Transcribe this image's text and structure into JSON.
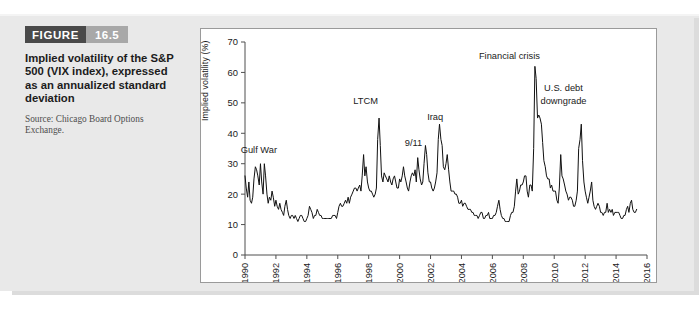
{
  "figure": {
    "label": "FIGURE",
    "number": "16.5",
    "caption": "Implied volatility of the S&P 500 (VIX index), expressed as an annualized standard deviation",
    "source": "Source: Chicago Board Options Exchange."
  },
  "chart_data": {
    "type": "line",
    "title": "",
    "xlabel": "",
    "ylabel": "Implied volatility (%)",
    "xlim": [
      1990,
      2016
    ],
    "ylim": [
      0,
      70
    ],
    "grid": false,
    "legend": "none",
    "yticks": [
      0,
      10,
      20,
      30,
      40,
      50,
      60,
      70
    ],
    "xticks": [
      1990,
      1992,
      1994,
      1996,
      1998,
      2000,
      2002,
      2004,
      2006,
      2008,
      2010,
      2012,
      2014,
      2016
    ],
    "annotations": [
      {
        "text": "Gulf War",
        "x": 1990.9,
        "y": 33.5
      },
      {
        "text": "LTCM",
        "x": 1997.8,
        "y": 49.5
      },
      {
        "text": "9/11",
        "x": 2000.9,
        "y": 36.0
      },
      {
        "text": "Iraq",
        "x": 2002.3,
        "y": 44.5
      },
      {
        "text": "Financial crisis",
        "x": 2007.1,
        "y": 64.5
      },
      {
        "text": "U.S. debt",
        "x": 2010.6,
        "y": 54.0
      },
      {
        "text": "downgrade",
        "x": 2010.6,
        "y": 49.5
      }
    ],
    "series": [
      {
        "name": "VIX",
        "x": [
          1990.0,
          1990.08,
          1990.17,
          1990.25,
          1990.33,
          1990.42,
          1990.5,
          1990.58,
          1990.67,
          1990.75,
          1990.83,
          1990.92,
          1991.0,
          1991.08,
          1991.17,
          1991.25,
          1991.33,
          1991.42,
          1991.5,
          1991.58,
          1991.67,
          1991.75,
          1991.83,
          1991.92,
          1992.0,
          1992.08,
          1992.17,
          1992.25,
          1992.33,
          1992.42,
          1992.5,
          1992.58,
          1992.67,
          1992.75,
          1992.83,
          1992.92,
          1993.0,
          1993.08,
          1993.17,
          1993.25,
          1993.33,
          1993.42,
          1993.5,
          1993.58,
          1993.67,
          1993.75,
          1993.83,
          1993.92,
          1994.0,
          1994.08,
          1994.17,
          1994.25,
          1994.33,
          1994.42,
          1994.5,
          1994.58,
          1994.67,
          1994.75,
          1994.83,
          1994.92,
          1995.0,
          1995.08,
          1995.17,
          1995.25,
          1995.33,
          1995.42,
          1995.5,
          1995.58,
          1995.67,
          1995.75,
          1995.83,
          1995.92,
          1996.0,
          1996.08,
          1996.17,
          1996.25,
          1996.33,
          1996.42,
          1996.5,
          1996.58,
          1996.67,
          1996.75,
          1996.83,
          1996.92,
          1997.0,
          1997.08,
          1997.17,
          1997.25,
          1997.33,
          1997.42,
          1997.5,
          1997.58,
          1997.67,
          1997.75,
          1997.83,
          1997.92,
          1998.0,
          1998.08,
          1998.17,
          1998.25,
          1998.33,
          1998.42,
          1998.5,
          1998.58,
          1998.67,
          1998.75,
          1998.83,
          1998.92,
          1999.0,
          1999.08,
          1999.17,
          1999.25,
          1999.33,
          1999.42,
          1999.5,
          1999.58,
          1999.67,
          1999.75,
          1999.83,
          1999.92,
          2000.0,
          2000.08,
          2000.17,
          2000.25,
          2000.33,
          2000.42,
          2000.5,
          2000.58,
          2000.67,
          2000.75,
          2000.83,
          2000.92,
          2001.0,
          2001.08,
          2001.17,
          2001.25,
          2001.33,
          2001.42,
          2001.5,
          2001.58,
          2001.67,
          2001.75,
          2001.83,
          2001.92,
          2002.0,
          2002.08,
          2002.17,
          2002.25,
          2002.33,
          2002.42,
          2002.5,
          2002.58,
          2002.67,
          2002.75,
          2002.83,
          2002.92,
          2003.0,
          2003.08,
          2003.17,
          2003.25,
          2003.33,
          2003.42,
          2003.5,
          2003.58,
          2003.67,
          2003.75,
          2003.83,
          2003.92,
          2004.0,
          2004.08,
          2004.17,
          2004.25,
          2004.33,
          2004.42,
          2004.5,
          2004.58,
          2004.67,
          2004.75,
          2004.83,
          2004.92,
          2005.0,
          2005.08,
          2005.17,
          2005.25,
          2005.33,
          2005.42,
          2005.5,
          2005.58,
          2005.67,
          2005.75,
          2005.83,
          2005.92,
          2006.0,
          2006.08,
          2006.17,
          2006.25,
          2006.33,
          2006.42,
          2006.5,
          2006.58,
          2006.67,
          2006.75,
          2006.83,
          2006.92,
          2007.0,
          2007.08,
          2007.17,
          2007.25,
          2007.33,
          2007.42,
          2007.5,
          2007.58,
          2007.67,
          2007.75,
          2007.83,
          2007.92,
          2008.0,
          2008.08,
          2008.17,
          2008.25,
          2008.33,
          2008.42,
          2008.5,
          2008.58,
          2008.67,
          2008.75,
          2008.83,
          2008.92,
          2009.0,
          2009.08,
          2009.17,
          2009.25,
          2009.33,
          2009.42,
          2009.5,
          2009.58,
          2009.67,
          2009.75,
          2009.83,
          2009.92,
          2010.0,
          2010.08,
          2010.17,
          2010.25,
          2010.33,
          2010.42,
          2010.5,
          2010.58,
          2010.67,
          2010.75,
          2010.83,
          2010.92,
          2011.0,
          2011.08,
          2011.17,
          2011.25,
          2011.33,
          2011.42,
          2011.5,
          2011.58,
          2011.67,
          2011.75,
          2011.83,
          2011.92,
          2012.0,
          2012.08,
          2012.17,
          2012.25,
          2012.33,
          2012.42,
          2012.5,
          2012.58,
          2012.67,
          2012.75,
          2012.83,
          2012.92,
          2013.0,
          2013.08,
          2013.17,
          2013.25,
          2013.33,
          2013.42,
          2013.5,
          2013.58,
          2013.67,
          2013.75,
          2013.83,
          2013.92,
          2014.0,
          2014.08,
          2014.17,
          2014.25,
          2014.33,
          2014.42,
          2014.5,
          2014.58,
          2014.67,
          2014.75,
          2014.83,
          2014.92,
          2015.0,
          2015.08,
          2015.17,
          2015.25,
          2015.33
        ],
        "values": [
          26,
          22,
          19,
          24,
          18,
          17,
          19,
          25,
          29,
          28,
          26,
          23,
          30,
          24,
          20,
          30,
          26,
          20,
          17,
          19,
          18,
          21,
          19,
          16,
          18,
          16,
          15,
          17,
          15,
          14,
          13,
          16,
          18,
          15,
          13,
          12,
          13,
          13,
          12,
          13,
          12,
          11,
          12,
          13,
          13,
          12,
          11,
          11,
          12,
          13,
          16,
          15,
          14,
          12,
          13,
          13,
          15,
          14,
          13,
          13,
          12,
          12,
          12,
          12,
          12,
          12,
          12,
          12,
          13,
          13,
          13,
          12,
          14,
          16,
          17,
          16,
          16,
          17,
          18,
          17,
          19,
          17,
          19,
          20,
          21,
          22,
          22,
          21,
          22,
          23,
          21,
          26,
          33,
          26,
          29,
          24,
          22,
          21,
          21,
          20,
          19,
          20,
          22,
          38,
          45,
          36,
          26,
          24,
          27,
          26,
          25,
          24,
          26,
          24,
          23,
          25,
          26,
          24,
          22,
          22,
          25,
          24,
          26,
          29,
          26,
          24,
          22,
          21,
          24,
          26,
          27,
          26,
          28,
          24,
          32,
          28,
          25,
          23,
          24,
          30,
          36,
          33,
          27,
          24,
          24,
          22,
          21,
          22,
          24,
          27,
          38,
          43,
          38,
          36,
          29,
          28,
          30,
          33,
          28,
          24,
          21,
          21,
          21,
          20,
          20,
          19,
          17,
          17,
          18,
          16,
          17,
          17,
          16,
          15,
          15,
          15,
          14,
          14,
          13,
          13,
          13,
          12,
          13,
          14,
          14,
          12,
          12,
          13,
          13,
          14,
          12,
          12,
          12,
          13,
          13,
          14,
          16,
          18,
          15,
          13,
          12,
          12,
          11,
          11,
          11,
          11,
          13,
          14,
          14,
          16,
          21,
          25,
          20,
          21,
          23,
          23,
          24,
          26,
          26,
          21,
          19,
          23,
          23,
          21,
          35,
          62,
          58,
          45,
          46,
          45,
          43,
          37,
          31,
          29,
          26,
          25,
          25,
          22,
          23,
          21,
          21,
          21,
          18,
          17,
          22,
          33,
          26,
          25,
          23,
          21,
          20,
          18,
          19,
          19,
          18,
          16,
          16,
          18,
          21,
          35,
          38,
          43,
          31,
          24,
          21,
          19,
          17,
          19,
          21,
          24,
          18,
          16,
          15,
          16,
          17,
          16,
          14,
          14,
          13,
          14,
          14,
          17,
          14,
          15,
          14,
          15,
          13,
          14,
          14,
          14,
          14,
          13,
          12,
          12,
          13,
          13,
          15,
          16,
          14,
          17,
          18,
          15,
          14,
          14,
          15
        ]
      }
    ]
  }
}
